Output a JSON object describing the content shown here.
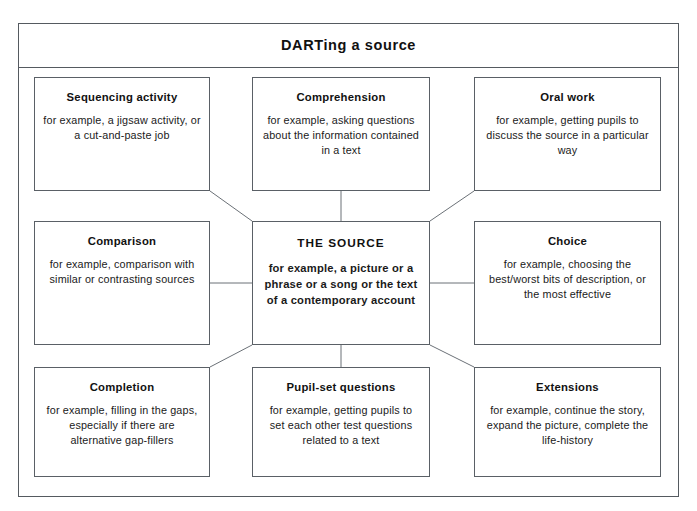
{
  "title": "DARTing a source",
  "colors": {
    "frame_border": "#555a60",
    "box_border": "#5a6066",
    "connector": "#6b7177",
    "text": "#111111",
    "background": "#ffffff"
  },
  "center": {
    "heading": "THE SOURCE",
    "body": "for example, a picture or a phrase or a song or the text of a contemporary account"
  },
  "nodes": [
    {
      "id": "sequencing",
      "heading": "Sequencing activity",
      "body": "for example, a jigsaw activity, or a cut-and-paste job"
    },
    {
      "id": "comprehension",
      "heading": "Comprehension",
      "body": "for example, asking questions about the information contained in a text"
    },
    {
      "id": "oral",
      "heading": "Oral work",
      "body": "for example, getting pupils to discuss the source in a particular way"
    },
    {
      "id": "comparison",
      "heading": "Comparison",
      "body": "for example, comparison with similar or contrasting sources"
    },
    {
      "id": "choice",
      "heading": "Choice",
      "body": "for example, choosing the best/worst bits of description, or the most effective"
    },
    {
      "id": "completion",
      "heading": "Completion",
      "body": "for example, filling in the gaps, especially if there are alternative gap-fillers"
    },
    {
      "id": "pupilset",
      "heading": "Pupil-set questions",
      "body": "for example, getting pupils to set each other test questions related to a text"
    },
    {
      "id": "extensions",
      "heading": "Extensions",
      "body": "for example, continue the story, expand the picture, complete the life-history"
    }
  ],
  "connections": [
    {
      "from": "sequencing",
      "to": "center"
    },
    {
      "from": "comprehension",
      "to": "center"
    },
    {
      "from": "oral",
      "to": "center"
    },
    {
      "from": "comparison",
      "to": "center"
    },
    {
      "from": "choice",
      "to": "center"
    },
    {
      "from": "completion",
      "to": "center"
    },
    {
      "from": "pupilset",
      "to": "center"
    },
    {
      "from": "extensions",
      "to": "center"
    }
  ]
}
